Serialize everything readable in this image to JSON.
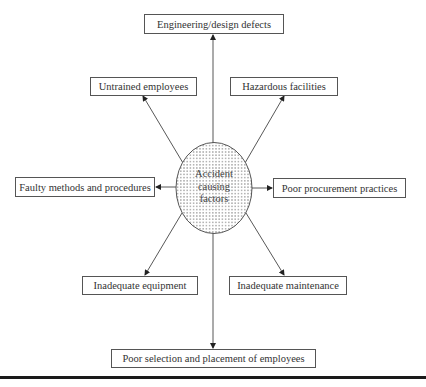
{
  "diagram": {
    "title": "Accident causing factors",
    "center": {
      "lines": [
        "Accident",
        "causing",
        "factors"
      ],
      "fill_pattern": "dotted",
      "shape": "ellipse"
    },
    "factors": [
      {
        "id": "top",
        "label": "Engineering/design defects"
      },
      {
        "id": "upper-left",
        "label": "Untrained employees"
      },
      {
        "id": "upper-right",
        "label": "Hazardous facilities"
      },
      {
        "id": "left",
        "label": "Faulty methods and procedures"
      },
      {
        "id": "right",
        "label": "Poor procurement practices"
      },
      {
        "id": "lower-left",
        "label": "Inadequate equipment"
      },
      {
        "id": "lower-right",
        "label": "Inadequate maintenance"
      },
      {
        "id": "bottom",
        "label": "Poor selection and placement of employees"
      }
    ],
    "colors": {
      "line": "#444444",
      "box_border": "#555555",
      "text": "#333333",
      "rule": "#1a1a1a"
    }
  }
}
